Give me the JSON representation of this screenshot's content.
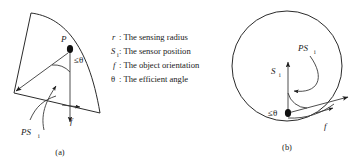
{
  "figure": {
    "background_color": "#ffffff",
    "line_color": "#2b2b2b",
    "legend": {
      "items": [
        {
          "symbol": "r",
          "symbol_style": "italic",
          "sub": "",
          "text": ": The sensing radius"
        },
        {
          "symbol": "S",
          "symbol_style": "italic",
          "sub": "i",
          "text": ": The sensor position"
        },
        {
          "symbol": "f",
          "symbol_style": "italic",
          "sub": "",
          "text": ": The object orientation"
        },
        {
          "symbol": "θ",
          "symbol_style": "normal",
          "sub": "",
          "text": ": The efficient angle"
        }
      ]
    },
    "panel_a": {
      "caption": "(a)",
      "point_label": "P",
      "angle_label": "≤θ",
      "vector_label": "PS",
      "vector_sub": "i",
      "orientation_label": "f"
    },
    "panel_b": {
      "caption": "(b)",
      "sensor_label": "S",
      "sensor_sub": "i",
      "angle_label": "≤θ",
      "vector_label": "PS",
      "vector_sub": "i",
      "orientation_label": "f"
    }
  }
}
